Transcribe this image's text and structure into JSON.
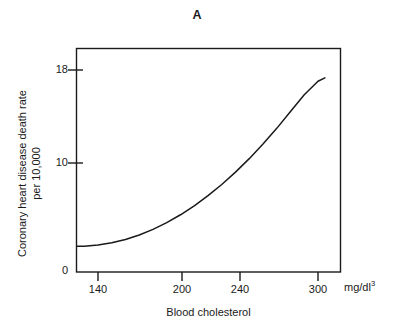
{
  "figure": {
    "panel_title": "A",
    "background_color": "#ffffff",
    "line_color": "#1a1a1a",
    "axis_color": "#1a1a1a"
  },
  "chart_data": {
    "type": "line",
    "title": "A",
    "xlabel": "Blood cholesterol",
    "xunit": "mg/dl",
    "xunit_superscript": "3",
    "ylabel_line1": "Coronary heart disease death rate",
    "ylabel_line2": "per 10,000",
    "xlim": [
      125,
      310
    ],
    "ylim": [
      0,
      19.2
    ],
    "xticks": [
      140,
      200,
      240,
      300
    ],
    "xtick_labels": [
      "140",
      "200",
      "240",
      "300"
    ],
    "yticks": [
      0,
      10,
      18
    ],
    "ytick_labels": [
      "0",
      "10",
      "18"
    ],
    "grid": false,
    "legend": false,
    "series": [
      {
        "name": "Coronary heart disease death rate",
        "x": [
          125,
          130,
          140,
          150,
          160,
          170,
          180,
          190,
          200,
          210,
          220,
          230,
          240,
          250,
          260,
          270,
          280,
          290,
          300,
          305
        ],
        "values": [
          2.3,
          2.3,
          2.4,
          2.6,
          2.9,
          3.3,
          3.8,
          4.4,
          5.1,
          5.9,
          6.8,
          7.8,
          8.9,
          10.1,
          11.4,
          12.8,
          14.3,
          15.8,
          17.0,
          17.3
        ]
      }
    ]
  }
}
